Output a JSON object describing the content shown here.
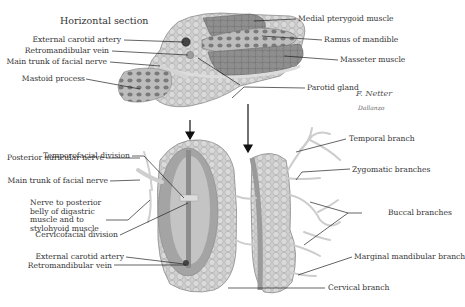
{
  "figure": {
    "title": "Horizontal section",
    "signature": "F. Netter",
    "signature2": "Dallanzo"
  },
  "top_labels_left": [
    {
      "id": "ext-carotid-top",
      "text": "External carotid artery"
    },
    {
      "id": "retromandibular-top",
      "text": "Retromandibular vein"
    },
    {
      "id": "facial-trunk-top",
      "text": "Main trunk of facial nerve"
    },
    {
      "id": "mastoid",
      "text": "Mastoid process"
    }
  ],
  "top_labels_right": [
    {
      "id": "medial-pterygoid",
      "text": "Medial pterygoid muscle"
    },
    {
      "id": "ramus",
      "text": "Ramus of mandible"
    },
    {
      "id": "masseter",
      "text": "Masseter muscle"
    },
    {
      "id": "parotid",
      "text": "Parotid gland"
    }
  ],
  "bottom_labels_left": [
    {
      "id": "temporofacial",
      "text": "Temporofacial division"
    },
    {
      "id": "post-auricular",
      "text": "Posterior auricular nerve"
    },
    {
      "id": "facial-trunk-bottom",
      "text": "Main trunk of facial nerve"
    },
    {
      "id": "digastric",
      "text": "Nerve to posterior belly of digastric muscle and to stylohyoid muscle"
    },
    {
      "id": "cervicofacial",
      "text": "Cervicofacial division"
    },
    {
      "id": "ext-carotid-bottom",
      "text": "External carotid artery"
    },
    {
      "id": "retromandibular-bottom",
      "text": "Retromandibular vein"
    }
  ],
  "bottom_labels_right": [
    {
      "id": "temporal",
      "text": "Temporal branch"
    },
    {
      "id": "zygomatic",
      "text": "Zygomatic branches"
    },
    {
      "id": "buccal",
      "text": "Buccal branches"
    },
    {
      "id": "marginal",
      "text": "Marginal mandibular branch"
    },
    {
      "id": "cervical",
      "text": "Cervical branch"
    }
  ],
  "colors": {
    "gland": "#c9c9c9",
    "gland_dark": "#9a9a9a",
    "muscle": "#8a8a8a",
    "bone": "#b0b0b0",
    "nerve": "#d8d8d8",
    "leader": "#222222"
  }
}
